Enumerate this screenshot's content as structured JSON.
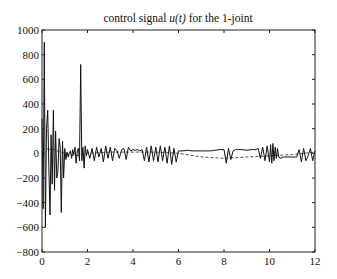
{
  "chart_data": {
    "type": "line",
    "title_prefix": "control signal ",
    "title_var": "u(t)",
    "title_suffix": " for the 1-joint",
    "title": "control signal u(t) for the 1-joint",
    "xlabel": "",
    "ylabel": "",
    "xlim": [
      0,
      12
    ],
    "ylim": [
      -800,
      1000
    ],
    "xticks": [
      0,
      2,
      4,
      6,
      8,
      10,
      12
    ],
    "yticks": [
      1000,
      800,
      600,
      400,
      200,
      0,
      -200,
      -400,
      -600,
      -800
    ],
    "xtick_labels": [
      "0",
      "2",
      "4",
      "6",
      "8",
      "10",
      "12"
    ],
    "ytick_labels": [
      "1000",
      "800",
      "600",
      "400",
      "200",
      "0",
      "−200",
      "−400",
      "−600",
      "−800"
    ],
    "grid": false,
    "legend": null,
    "series": [
      {
        "name": "u(t)",
        "style": "solid",
        "x": [
          0,
          0.05,
          0.1,
          0.15,
          0.2,
          0.25,
          0.3,
          0.35,
          0.4,
          0.45,
          0.5,
          0.55,
          0.6,
          0.65,
          0.7,
          0.75,
          0.8,
          0.85,
          0.9,
          0.95,
          1.0,
          1.05,
          1.1,
          1.15,
          1.2,
          1.25,
          1.3,
          1.35,
          1.4,
          1.45,
          1.5,
          1.55,
          1.6,
          1.65,
          1.7,
          1.75,
          1.8,
          1.85,
          1.9,
          1.95,
          2.0,
          2.1,
          2.2,
          2.3,
          2.4,
          2.5,
          2.6,
          2.7,
          2.8,
          2.9,
          3.0,
          3.1,
          3.2,
          3.3,
          3.4,
          3.5,
          3.6,
          3.7,
          3.8,
          3.9,
          4.0,
          4.1,
          4.2,
          4.3,
          4.4,
          4.5,
          4.6,
          4.7,
          4.8,
          4.9,
          5.0,
          5.1,
          5.2,
          5.3,
          5.4,
          5.5,
          5.6,
          5.7,
          5.8,
          5.9,
          6.0,
          6.2,
          6.4,
          6.6,
          6.8,
          7.0,
          7.2,
          7.4,
          7.6,
          7.8,
          8.0,
          8.1,
          8.2,
          8.3,
          8.4,
          8.5,
          8.6,
          8.8,
          9.0,
          9.2,
          9.4,
          9.5,
          9.6,
          9.7,
          9.8,
          9.9,
          10.0,
          10.05,
          10.1,
          10.15,
          10.2,
          10.25,
          10.3,
          10.35,
          10.4,
          10.5,
          10.6,
          10.8,
          11.0,
          11.2,
          11.3,
          11.4,
          11.5,
          11.6,
          11.7,
          11.8,
          11.9,
          12.0
        ],
        "y": [
          280,
          -450,
          900,
          -600,
          200,
          350,
          -100,
          -500,
          150,
          -250,
          350,
          -300,
          180,
          -200,
          -150,
          120,
          50,
          -480,
          100,
          -200,
          40,
          -50,
          10,
          -30,
          0,
          20,
          -40,
          30,
          -10,
          50,
          -80,
          20,
          40,
          -60,
          720,
          -60,
          50,
          -120,
          60,
          -20,
          30,
          -40,
          40,
          -60,
          50,
          -30,
          40,
          -70,
          60,
          -40,
          50,
          -60,
          40,
          20,
          -40,
          30,
          40,
          -50,
          50,
          20,
          30,
          25,
          30,
          20,
          30,
          -60,
          50,
          -70,
          60,
          -60,
          50,
          -70,
          60,
          -60,
          50,
          -80,
          60,
          -90,
          40,
          -70,
          20,
          20,
          25,
          20,
          20,
          20,
          20,
          20,
          25,
          30,
          30,
          -80,
          40,
          -50,
          20,
          30,
          30,
          30,
          25,
          30,
          30,
          40,
          -40,
          50,
          -60,
          60,
          -70,
          70,
          -80,
          80,
          -60,
          50,
          -40,
          40,
          -30,
          -40,
          -30,
          -30,
          -30,
          -30,
          30,
          -70,
          40,
          -60,
          -20,
          40,
          -60,
          20
        ]
      },
      {
        "name": "reference",
        "style": "dashed",
        "x": [
          0,
          0.5,
          1.0,
          1.5,
          2.0,
          3.0,
          4.0,
          5.0,
          6.0,
          7.0,
          8.0,
          8.5,
          9.0,
          10.0,
          11.0,
          12.0
        ],
        "y": [
          40,
          30,
          0,
          -20,
          0,
          10,
          10,
          10,
          0,
          -30,
          -40,
          -35,
          -30,
          -20,
          -10,
          10
        ]
      }
    ]
  }
}
